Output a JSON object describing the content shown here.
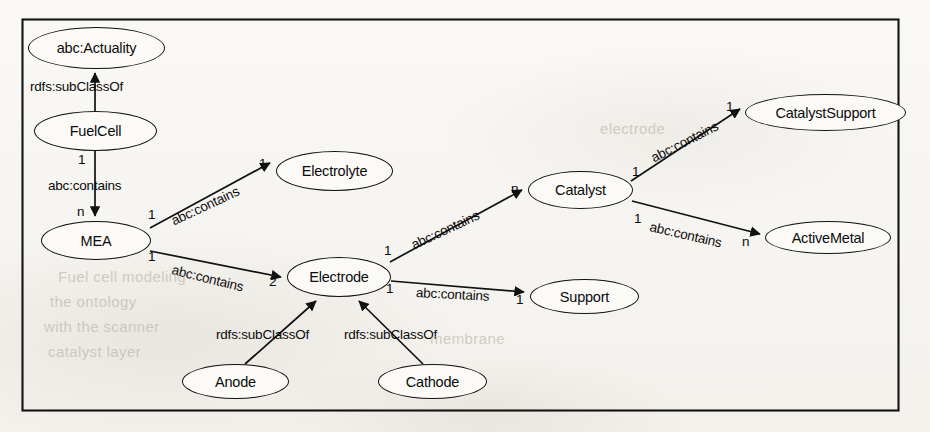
{
  "diagram": {
    "border_color": "#111111",
    "background_color": "#f7f6f2",
    "nodes": [
      {
        "id": "actuality",
        "label": "abc:Actuality",
        "x": 28,
        "y": 27,
        "w": 137,
        "h": 42
      },
      {
        "id": "fuelcell",
        "label": "FuelCell",
        "x": 34,
        "y": 111,
        "w": 123,
        "h": 40
      },
      {
        "id": "mea",
        "label": "MEA",
        "x": 41,
        "y": 221,
        "w": 110,
        "h": 39
      },
      {
        "id": "electrolyte",
        "label": "Electrolyte",
        "x": 276,
        "y": 151,
        "w": 117,
        "h": 40
      },
      {
        "id": "electrode",
        "label": "Electrode",
        "x": 287,
        "y": 257,
        "w": 104,
        "h": 40
      },
      {
        "id": "catalyst",
        "label": "Catalyst",
        "x": 528,
        "y": 171,
        "w": 105,
        "h": 38
      },
      {
        "id": "catalystsupport",
        "label": "CatalystSupport",
        "x": 745,
        "y": 94,
        "w": 161,
        "h": 37
      },
      {
        "id": "activemetal",
        "label": "ActiveMetal",
        "x": 765,
        "y": 221,
        "w": 126,
        "h": 33
      },
      {
        "id": "support",
        "label": "Support",
        "x": 530,
        "y": 279,
        "w": 109,
        "h": 35
      },
      {
        "id": "anode",
        "label": "Anode",
        "x": 182,
        "y": 364,
        "w": 107,
        "h": 35
      },
      {
        "id": "cathode",
        "label": "Cathode",
        "x": 378,
        "y": 364,
        "w": 109,
        "h": 35
      }
    ],
    "edges": [
      {
        "id": "fuelcell-subclassof-actuality",
        "from": "fuelcell",
        "to": "actuality",
        "predicate": "rdfs:subClassOf",
        "source_cardinality": "",
        "target_cardinality": ""
      },
      {
        "id": "fuelcell-contains-mea",
        "from": "fuelcell",
        "to": "mea",
        "predicate": "abc:contains",
        "source_cardinality": "1",
        "target_cardinality": "n"
      },
      {
        "id": "mea-contains-electrolyte",
        "from": "mea",
        "to": "electrolyte",
        "predicate": "abc:contains",
        "source_cardinality": "1",
        "target_cardinality": "1"
      },
      {
        "id": "mea-contains-electrode",
        "from": "mea",
        "to": "electrode",
        "predicate": "abc:contains",
        "source_cardinality": "1",
        "target_cardinality": "2"
      },
      {
        "id": "electrode-contains-catalyst",
        "from": "electrode",
        "to": "catalyst",
        "predicate": "abc:contains",
        "source_cardinality": "1",
        "target_cardinality": "n"
      },
      {
        "id": "electrode-contains-support",
        "from": "electrode",
        "to": "support",
        "predicate": "abc:contains",
        "source_cardinality": "1",
        "target_cardinality": "1"
      },
      {
        "id": "catalyst-contains-catalystsupport",
        "from": "catalyst",
        "to": "catalystsupport",
        "predicate": "abc:contains",
        "source_cardinality": "1",
        "target_cardinality": "1"
      },
      {
        "id": "catalyst-contains-activemetal",
        "from": "catalyst",
        "to": "activemetal",
        "predicate": "abc:contains",
        "source_cardinality": "1",
        "target_cardinality": "n"
      },
      {
        "id": "anode-subclassof-electrode",
        "from": "anode",
        "to": "electrode",
        "predicate": "rdfs:subClassOf",
        "source_cardinality": "",
        "target_cardinality": ""
      },
      {
        "id": "cathode-subclassof-electrode",
        "from": "cathode",
        "to": "electrode",
        "predicate": "rdfs:subClassOf",
        "source_cardinality": "",
        "target_cardinality": ""
      }
    ],
    "edge_labels": [
      {
        "id": "lbl-subclassof-fuelcell",
        "text": "rdfs:subClassOf",
        "x": 30,
        "y": 79,
        "rotate": 0
      },
      {
        "id": "lbl-contains-mea",
        "text": "abc:contains",
        "x": 48,
        "y": 178,
        "rotate": 0
      },
      {
        "id": "lbl-contains-electrolyte",
        "text": "abc:contains",
        "x": 172,
        "y": 214,
        "rotate": -25
      },
      {
        "id": "lbl-contains-electrode",
        "text": "abc:contains",
        "x": 172,
        "y": 262,
        "rotate": 14
      },
      {
        "id": "lbl-contains-catalyst",
        "text": "abc:contains",
        "x": 412,
        "y": 238,
        "rotate": -25
      },
      {
        "id": "lbl-contains-support",
        "text": "abc:contains",
        "x": 416,
        "y": 285,
        "rotate": 3
      },
      {
        "id": "lbl-contains-catsupport",
        "text": "abc:contains",
        "x": 652,
        "y": 151,
        "rotate": -27
      },
      {
        "id": "lbl-contains-activemetal",
        "text": "abc:contains",
        "x": 650,
        "y": 219,
        "rotate": 13
      },
      {
        "id": "lbl-subclassof-anode",
        "text": "rdfs:subClassOf",
        "x": 216,
        "y": 327,
        "rotate": 0
      },
      {
        "id": "lbl-subclassof-cathode",
        "text": "rdfs:subClassOf",
        "x": 344,
        "y": 327,
        "rotate": 0
      }
    ],
    "cardinality_labels": [
      {
        "id": "card-fuelcell-out",
        "text": "1",
        "x": 78,
        "y": 152
      },
      {
        "id": "card-mea-in",
        "text": "n",
        "x": 77,
        "y": 204
      },
      {
        "id": "card-mea-out-1",
        "text": "1",
        "x": 148,
        "y": 207
      },
      {
        "id": "card-electrolyte-in",
        "text": "1",
        "x": 259,
        "y": 156
      },
      {
        "id": "card-mea-out-2",
        "text": "1",
        "x": 148,
        "y": 249
      },
      {
        "id": "card-electrode-in",
        "text": "2",
        "x": 269,
        "y": 274
      },
      {
        "id": "card-electrode-out-1",
        "text": "1",
        "x": 384,
        "y": 243
      },
      {
        "id": "card-catalyst-in",
        "text": "n",
        "x": 511,
        "y": 181
      },
      {
        "id": "card-electrode-out-2",
        "text": "1",
        "x": 386,
        "y": 281
      },
      {
        "id": "card-support-in",
        "text": "1",
        "x": 516,
        "y": 292
      },
      {
        "id": "card-catalyst-out-1",
        "text": "1",
        "x": 632,
        "y": 164
      },
      {
        "id": "card-catsupport-in",
        "text": "1",
        "x": 726,
        "y": 99
      },
      {
        "id": "card-catalyst-out-2",
        "text": "1",
        "x": 634,
        "y": 211
      },
      {
        "id": "card-activemetal-in",
        "text": "n",
        "x": 742,
        "y": 234
      }
    ],
    "ghost_text": [
      {
        "id": "ghost-1",
        "text": "Fuel cell modeling",
        "x": 58,
        "y": 268,
        "rotate": 0
      },
      {
        "id": "ghost-2",
        "text": "the ontology",
        "x": 50,
        "y": 293,
        "rotate": 0
      },
      {
        "id": "ghost-3",
        "text": "with the scanner",
        "x": 44,
        "y": 318,
        "rotate": 0
      },
      {
        "id": "ghost-4",
        "text": "catalyst layer",
        "x": 48,
        "y": 343,
        "rotate": 0
      },
      {
        "id": "ghost-5",
        "text": "membrane",
        "x": 430,
        "y": 330,
        "rotate": 0
      },
      {
        "id": "ghost-6",
        "text": "electrode",
        "x": 600,
        "y": 120,
        "rotate": 0
      }
    ],
    "caption_region": {
      "text": "",
      "y": 418
    }
  }
}
